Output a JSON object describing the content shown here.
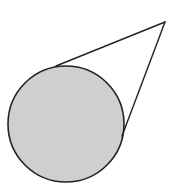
{
  "diagram": {
    "colors": {
      "background": "#ffffff",
      "circle_fill": "#cfcfcf",
      "stroke": "#222222"
    },
    "circle": {
      "cx": 66,
      "cy": 124,
      "r": 58
    },
    "external_point": {
      "x": 165,
      "y": 22
    },
    "tangent_points": [
      {
        "x": 56,
        "y": 66
      },
      {
        "x": 122,
        "y": 136
      }
    ]
  }
}
